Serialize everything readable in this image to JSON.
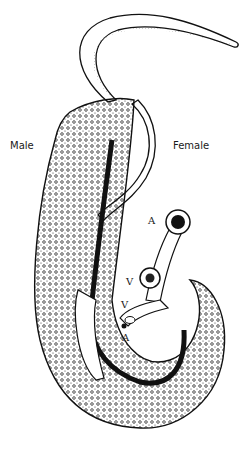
{
  "figure": {
    "labels": {
      "male": "Male",
      "female": "Female",
      "anterior_top": "A",
      "ventral_upper": "V",
      "ventral_lower": "V",
      "anterior_lower": "A"
    },
    "colors": {
      "ink": "#111111",
      "paper": "#ffffff"
    }
  }
}
